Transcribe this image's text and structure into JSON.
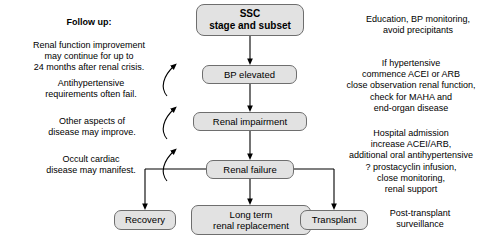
{
  "diagram": {
    "accent_fill": "#e2e2e2",
    "accent_stroke": "#6e6e6e",
    "line_color": "#000000",
    "nodes": {
      "ssc": "SSC\nstage and subset",
      "bp_elevated": "BP elevated",
      "renal_impairment": "Renal impairment",
      "renal_failure": "Renal failure",
      "recovery": "Recovery",
      "long_term_renal_replacement": "Long term\nrenal replacement",
      "transplant": "Transplant"
    },
    "left_notes": {
      "followup_heading": "Follow up:",
      "followup_body": "Renal function improvement\nmay continue for up to\n24 months after renal crisis.",
      "antihypertensive": "Antihypertensive\nrequirements often fail.",
      "other_aspects": "Other aspects of\ndisease may improve.",
      "occult_cardiac": "Occult cardiac\ndisease may manifest."
    },
    "right_notes": {
      "education": "Education, BP monitoring,\navoid precipitants",
      "hypertensive": "If hypertensive\ncommence ACEI or ARB\nclose observation renal function,\ncheck for MAHA and\nend-organ disease",
      "hospital": "Hospital admission\nincrease ACEI/ARB,\nadditional oral antihypertensive\n? prostacyclin infusion,\nclose monitoring,\nrenal support",
      "post_transplant": "Post-transplant\nsurveillance"
    }
  }
}
